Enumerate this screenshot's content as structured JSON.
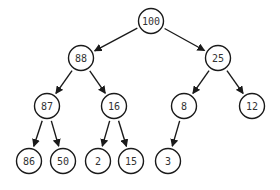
{
  "diagram": {
    "type": "binary-tree",
    "node_radius": 12.5,
    "colors": {
      "stroke": "#1a1a1a",
      "fill": "#ffffff",
      "text": "#333333"
    },
    "nodes": [
      {
        "id": "n100",
        "label": "100",
        "x": 151,
        "y": 21
      },
      {
        "id": "n88",
        "label": "88",
        "x": 81,
        "y": 58
      },
      {
        "id": "n25",
        "label": "25",
        "x": 218,
        "y": 58
      },
      {
        "id": "n87",
        "label": "87",
        "x": 47,
        "y": 106
      },
      {
        "id": "n16",
        "label": "16",
        "x": 114,
        "y": 106
      },
      {
        "id": "n8",
        "label": "8",
        "x": 184,
        "y": 106
      },
      {
        "id": "n12",
        "label": "12",
        "x": 252,
        "y": 106
      },
      {
        "id": "n86",
        "label": "86",
        "x": 29,
        "y": 161
      },
      {
        "id": "n50",
        "label": "50",
        "x": 63,
        "y": 161
      },
      {
        "id": "n2",
        "label": "2",
        "x": 98,
        "y": 161
      },
      {
        "id": "n15",
        "label": "15",
        "x": 131,
        "y": 161
      },
      {
        "id": "n3",
        "label": "3",
        "x": 168,
        "y": 161
      }
    ],
    "edges": [
      {
        "from": "n100",
        "to": "n88"
      },
      {
        "from": "n100",
        "to": "n25"
      },
      {
        "from": "n88",
        "to": "n87"
      },
      {
        "from": "n88",
        "to": "n16"
      },
      {
        "from": "n25",
        "to": "n8"
      },
      {
        "from": "n25",
        "to": "n12"
      },
      {
        "from": "n87",
        "to": "n86"
      },
      {
        "from": "n87",
        "to": "n50"
      },
      {
        "from": "n16",
        "to": "n2"
      },
      {
        "from": "n16",
        "to": "n15"
      },
      {
        "from": "n8",
        "to": "n3"
      }
    ]
  }
}
